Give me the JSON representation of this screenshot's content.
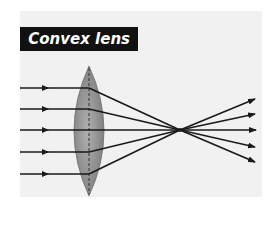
{
  "diagram": {
    "title": "Convex lens",
    "colors": {
      "background": "#f1f1f1",
      "title_bg": "#111111",
      "title_text": "#ffffff",
      "lens_fill": "#8f8f8f",
      "ray": "#1a1a1a"
    },
    "incoming_rays": 5,
    "outgoing_rays": 5,
    "focal_point": {
      "x": 180,
      "y": 130
    }
  }
}
